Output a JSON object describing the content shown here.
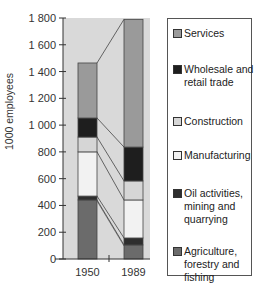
{
  "chart_data": {
    "type": "bar",
    "stacked": true,
    "title": "",
    "xlabel": "",
    "ylabel": "1000 employees",
    "ylim": [
      0,
      1800
    ],
    "yticks": [
      0,
      200,
      400,
      600,
      800,
      1000,
      1200,
      1400,
      1600,
      1800
    ],
    "ytick_labels": [
      "0",
      "200",
      "400",
      "600",
      "800",
      "1 000",
      "1 200",
      "1 400",
      "1 600",
      "1 800"
    ],
    "categories": [
      "1950",
      "1989"
    ],
    "series": [
      {
        "name": "Agriculture, forestry and fishing",
        "color": "#6b6b6b",
        "values": [
          441,
          105
        ]
      },
      {
        "name": "Oil activities, mining and quarrying",
        "color": "#2e2e2e",
        "values": [
          29,
          52
        ]
      },
      {
        "name": "Manufacturing",
        "color": "#f2f2f2",
        "values": [
          330,
          284
        ]
      },
      {
        "name": "Construction",
        "color": "#d6d6d6",
        "values": [
          111,
          142
        ]
      },
      {
        "name": "Wholesale and retail trade",
        "color": "#1e1e1e",
        "values": [
          142,
          253
        ]
      },
      {
        "name": "Services",
        "color": "#9a9a9a",
        "values": [
          411,
          954
        ]
      }
    ],
    "totals": [
      1464,
      1790
    ],
    "connector_lines": true,
    "grid": false,
    "legend_position": "right",
    "plot_background": "#d9d9d9"
  },
  "legend": {
    "items": [
      {
        "label": "Services",
        "lines": [
          "Services"
        ],
        "color": "#9a9a9a"
      },
      {
        "label": "Wholesale and retail trade",
        "lines": [
          "Wholesale and",
          "retail trade"
        ],
        "color": "#1e1e1e"
      },
      {
        "label": "Construction",
        "lines": [
          "Construction"
        ],
        "color": "#d6d6d6"
      },
      {
        "label": "Manufacturing",
        "lines": [
          "Manufacturing"
        ],
        "color": "#f2f2f2"
      },
      {
        "label": "Oil activities, mining and quarrying",
        "lines": [
          "Oil activities,",
          "mining and",
          "quarrying"
        ],
        "color": "#2e2e2e"
      },
      {
        "label": "Agriculture, forestry and fishing",
        "lines": [
          "Agriculture,",
          "forestry and",
          "fishing"
        ],
        "color": "#6b6b6b"
      }
    ]
  }
}
